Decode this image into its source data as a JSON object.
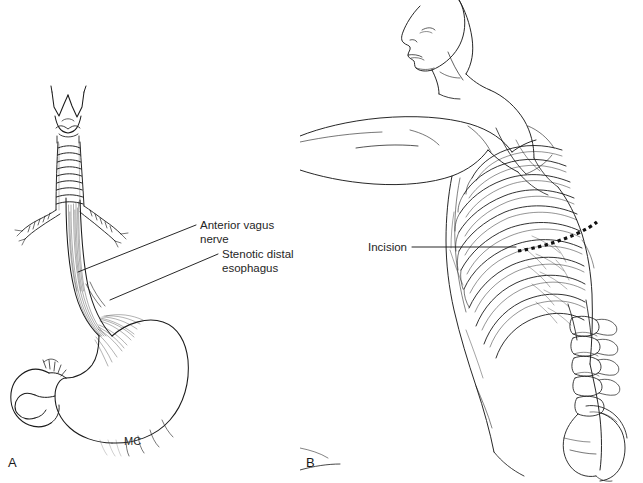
{
  "figure": {
    "background_color": "#ffffff",
    "ink_color": "#1b1b1b",
    "width": 643,
    "height": 483,
    "panel_count": 2
  },
  "panel_a": {
    "letter": "A",
    "subject": "esophagus-stomach-anatomy",
    "artist_signature": "MC",
    "labels": [
      {
        "id": "anterior-vagus-nerve",
        "text": "Anterior vagus nerve",
        "text_x": 200,
        "text_y": 219,
        "leader_from_x": 196,
        "leader_from_y": 225,
        "leader_to_x": 78,
        "leader_to_y": 272
      },
      {
        "id": "stenotic-distal-esophagus",
        "text": "Stenotic distal\nesophagus",
        "text_x": 222,
        "text_y": 248,
        "leader_from_x": 218,
        "leader_from_y": 254,
        "leader_to_x": 110,
        "leader_to_y": 300
      }
    ],
    "structures": [
      "larynx-thyroid-cartilage",
      "trachea-cartilage-rings",
      "carina",
      "right-main-bronchus",
      "left-main-bronchus",
      "esophagus",
      "vagus-nerve-plexus-fibers",
      "gastroesophageal-junction",
      "stomach-fundus",
      "stomach-body",
      "greater-curvature",
      "lesser-curvature",
      "pylorus",
      "duodenum"
    ]
  },
  "panel_b": {
    "letter": "B",
    "subject": "lateral-decubitus-thoracotomy-position",
    "labels": [
      {
        "id": "incision",
        "text": "Incision",
        "text_x": 68,
        "text_y": 241,
        "leader_from_x": 112,
        "leader_from_y": 247,
        "leader_to_x": 216,
        "leader_to_y": 247
      }
    ],
    "incision_line": {
      "style": "dashed",
      "dash_count": 15,
      "color": "#111111",
      "start_x": 218,
      "start_y": 251,
      "end_x": 297,
      "end_y": 222
    },
    "structures": [
      "head-profile",
      "neck",
      "raised-arm",
      "shoulder",
      "scapula",
      "rib-cage",
      "intercostal-spaces",
      "thoracic-vertebrae",
      "lumbar-vertebrae",
      "iliac-crest",
      "pelvis",
      "torso-outline",
      "hip",
      "thigh"
    ]
  }
}
